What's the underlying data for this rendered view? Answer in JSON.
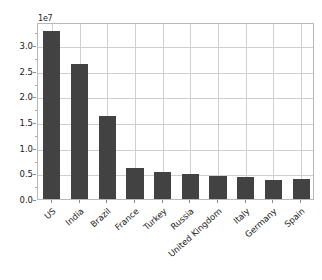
{
  "chart_data": {
    "type": "bar",
    "title": "",
    "xlabel": "",
    "ylabel": "",
    "offset_text": "1e7",
    "categories": [
      "US",
      "India",
      "Brazil",
      "France",
      "Turkey",
      "Russia",
      "United Kingdom",
      "Italy",
      "Germany",
      "Spain"
    ],
    "values": [
      32800000,
      26400000,
      16100000,
      6000000,
      5200000,
      4900000,
      4500000,
      4300000,
      3800000,
      3900000
    ],
    "values_scaled": [
      3.28,
      2.64,
      1.61,
      0.6,
      0.52,
      0.49,
      0.45,
      0.43,
      0.38,
      0.39
    ],
    "scale_factor": 10000000,
    "ylim": [
      0,
      3.45
    ],
    "ytick_values": [
      0.0,
      0.5,
      1.0,
      1.5,
      2.0,
      2.5,
      3.0
    ],
    "ytick_labels": [
      "0.0",
      "0.5",
      "1.0",
      "1.5",
      "2.0",
      "2.5",
      "3.0"
    ],
    "grid": true,
    "legend": false,
    "bar_color": "#424242",
    "grid_color": "#cfcfcf",
    "axes_color": "#b8b8b8",
    "text_color": "#1a1a1a",
    "background_color": "#ffffff"
  }
}
